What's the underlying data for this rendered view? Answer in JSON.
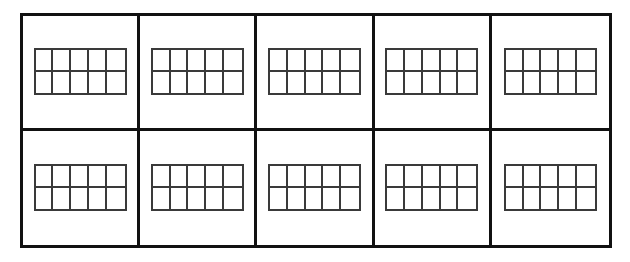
{
  "worksheet": {
    "title": "Blank Ten-Frames Worksheet",
    "outer_grid": {
      "rows": 2,
      "columns": 5,
      "total_cells": 10,
      "border_color": "#111111",
      "background_color": "#ffffff"
    },
    "ten_frame": {
      "rows": 2,
      "columns": 5,
      "total_cells": 10,
      "border_color": "#3a3a3a",
      "fill_color": "#ffffff",
      "counters_filled": 0
    },
    "cells": [
      {
        "index": 1,
        "row": 1,
        "column": 1,
        "label": "",
        "ten_frame_filled": 0
      },
      {
        "index": 2,
        "row": 1,
        "column": 2,
        "label": "",
        "ten_frame_filled": 0
      },
      {
        "index": 3,
        "row": 1,
        "column": 3,
        "label": "",
        "ten_frame_filled": 0
      },
      {
        "index": 4,
        "row": 1,
        "column": 4,
        "label": "",
        "ten_frame_filled": 0
      },
      {
        "index": 5,
        "row": 1,
        "column": 5,
        "label": "",
        "ten_frame_filled": 0
      },
      {
        "index": 6,
        "row": 2,
        "column": 1,
        "label": "",
        "ten_frame_filled": 0
      },
      {
        "index": 7,
        "row": 2,
        "column": 2,
        "label": "",
        "ten_frame_filled": 0
      },
      {
        "index": 8,
        "row": 2,
        "column": 3,
        "label": "",
        "ten_frame_filled": 0
      },
      {
        "index": 9,
        "row": 2,
        "column": 4,
        "label": "",
        "ten_frame_filled": 0
      },
      {
        "index": 10,
        "row": 2,
        "column": 5,
        "label": "",
        "ten_frame_filled": 0
      }
    ],
    "frame_cell_labels": [
      "",
      "",
      "",
      "",
      "",
      "",
      "",
      "",
      "",
      ""
    ]
  }
}
